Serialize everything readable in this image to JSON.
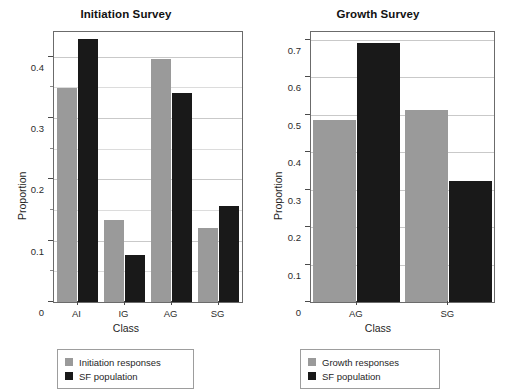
{
  "chart_data": [
    {
      "type": "bar",
      "title": "Initiation Survey",
      "xlabel": "Class",
      "ylabel": "Proportion",
      "categories": [
        "AI",
        "IG",
        "AG",
        "SG"
      ],
      "series": [
        {
          "name": "Initiation responses",
          "color": "#9a9a9a",
          "values": [
            0.348,
            0.133,
            0.396,
            0.12
          ]
        },
        {
          "name": "SF population",
          "color": "#191919",
          "values": [
            0.428,
            0.077,
            0.34,
            0.157
          ]
        }
      ],
      "ylim": [
        0,
        0.44
      ],
      "yticks": [
        0,
        0.1,
        0.2,
        0.3,
        0.4
      ],
      "ytick_labels": [
        "0",
        "0.1",
        "0.2",
        "0.3",
        "0.4"
      ],
      "yminor": [
        0.05,
        0.15,
        0.25,
        0.35
      ],
      "grid": true,
      "legend_position": "below"
    },
    {
      "type": "bar",
      "title": "Growth Survey",
      "xlabel": "Class",
      "ylabel": "Proportion",
      "categories": [
        "AG",
        "SG"
      ],
      "series": [
        {
          "name": "Growth responses",
          "color": "#9a9a9a",
          "values": [
            0.485,
            0.513
          ]
        },
        {
          "name": "SF population",
          "color": "#191919",
          "values": [
            0.69,
            0.322
          ]
        }
      ],
      "ylim": [
        0,
        0.72
      ],
      "yticks": [
        0,
        0.1,
        0.2,
        0.3,
        0.4,
        0.5,
        0.6,
        0.7
      ],
      "ytick_labels": [
        "0",
        "0.1",
        "0.2",
        "0.3",
        "0.4",
        "0.5",
        "0.6",
        "0.7"
      ],
      "yminor": [],
      "grid": true,
      "legend_position": "below"
    }
  ]
}
